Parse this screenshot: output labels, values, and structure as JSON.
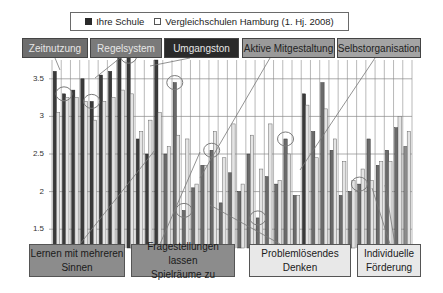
{
  "legend": {
    "series_a": "Ihre Schule",
    "series_b": "Vergleichschulen Hamburg (1. Hj. 2008)"
  },
  "top_labels": [
    {
      "text": "Zeitnutzung",
      "x": 22,
      "w": 66,
      "bg": "#6e6e6e",
      "fg": "#e6e6e6"
    },
    {
      "text": "Regelsystem",
      "x": 90,
      "w": 72,
      "bg": "#7a7a7a",
      "fg": "#e6e6e6"
    },
    {
      "text": "Umgangston",
      "x": 164,
      "w": 75,
      "bg": "#2a2a2a",
      "fg": "#e6e6e6"
    },
    {
      "text": "Aktive Mitgestaltung",
      "x": 242,
      "w": 93,
      "bg": "#9a9a9a",
      "fg": "#222222"
    },
    {
      "text": "Selbstorganisation",
      "x": 337,
      "w": 84,
      "bg": "#a4a4a4",
      "fg": "#222222"
    }
  ],
  "bottom_labels": [
    {
      "line1": "Lernen mit mehreren",
      "line2": "Sinnen",
      "x": 29,
      "w": 96,
      "bg": "#8c8c8c"
    },
    {
      "line1": "Fragestellungen lassen",
      "line2": "Spielräume zu",
      "x": 131,
      "w": 104,
      "bg": "#8c8c8c"
    },
    {
      "line1": "Problemlösendes",
      "line2": "Denken",
      "x": 249,
      "w": 102,
      "bg": "#e8e8e8"
    },
    {
      "line1": "Individuelle",
      "line2": "Förderung",
      "x": 357,
      "w": 64,
      "bg": "#e8e8e8"
    }
  ],
  "colors": {
    "ihre_schule_dark": "#3a3a3a",
    "ihre_schule_mid": "#6a6a6a",
    "ihre_schule_light": "#8c8c8c",
    "vergleich": "#e4e4e4",
    "grid": "#8a8a8a",
    "circle": "#7a7a7a"
  },
  "chart_data": {
    "type": "bar",
    "title": "",
    "xlabel": "",
    "ylabel": "",
    "ylim": [
      1.25,
      3.75
    ],
    "yticks": [
      1.5,
      2,
      2.5,
      3,
      3.5
    ],
    "grid": true,
    "legend_position": "top",
    "categories": [
      "1",
      "2",
      "3",
      "4",
      "5",
      "6",
      "7",
      "8",
      "9",
      "10",
      "11",
      "12",
      "13",
      "14",
      "15",
      "16",
      "17",
      "18",
      "19",
      "20",
      "21",
      "22",
      "23",
      "24",
      "25",
      "26",
      "27",
      "28",
      "29",
      "30",
      "31",
      "32",
      "33",
      "34",
      "35",
      "36",
      "37",
      "38",
      "39"
    ],
    "series": [
      {
        "name": "Ihre Schule",
        "values": [
          3.6,
          3.3,
          3.35,
          3.5,
          3.2,
          3.55,
          3.6,
          3.85,
          3.8,
          2.7,
          2.5,
          3.75,
          2.5,
          3.45,
          1.75,
          2.05,
          2.35,
          2.55,
          1.85,
          2.25,
          2.0,
          2.5,
          1.65,
          2.2,
          2.1,
          2.7,
          1.95,
          3.3,
          2.8,
          3.45,
          2.55,
          1.95,
          2.0,
          2.1,
          2.7,
          2.35,
          2.55,
          2.85,
          2.6
        ],
        "group_shade": [
          "dark",
          "dark",
          "dark",
          "dark",
          "dark",
          "dark",
          "dark",
          "dark",
          "dark",
          "dark",
          "dark",
          "dark",
          "mid",
          "mid",
          "mid",
          "mid",
          "mid",
          "mid",
          "mid",
          "mid",
          "mid",
          "mid",
          "mid",
          "mid",
          "mid",
          "mid",
          "mid",
          "dark",
          "mid",
          "mid",
          "mid",
          "mid",
          "mid",
          "mid",
          "mid",
          "mid",
          "mid",
          "mid",
          "light"
        ]
      },
      {
        "name": "Vergleichschulen Hamburg (1. Hj. 2008)",
        "values": [
          3.05,
          3.25,
          3.25,
          3.2,
          2.95,
          3.2,
          3.25,
          3.35,
          3.3,
          2.8,
          2.95,
          3.05,
          2.6,
          2.75,
          2.7,
          2.1,
          2.35,
          2.8,
          2.45,
          2.9,
          2.1,
          2.75,
          2.3,
          2.9,
          2.15,
          2.5,
          1.95,
          3.15,
          2.45,
          3.1,
          2.7,
          2.4,
          2.15,
          2.3,
          2.15,
          2.4,
          2.4,
          3.0,
          2.8
        ]
      }
    ],
    "highlight_circles": [
      {
        "label": "Zeitnutzung",
        "bar_index": 1
      },
      {
        "label": "Regelsystem",
        "bar_index": 4
      },
      {
        "label": "Umgangston",
        "bar_index": 8
      },
      {
        "label": "Lernen mit mehreren Sinnen",
        "bar_index": 14
      },
      {
        "label": "Fragestellungen lassen Spielräume zu",
        "bar_index": 13
      },
      {
        "label": "Aktive Mitgestaltung",
        "bar_index": 17
      },
      {
        "label": "Selbstorganisation",
        "bar_index": 22
      },
      {
        "label": "Problemlösendes Denken",
        "bar_index": 25
      },
      {
        "label": "Individuelle Förderung",
        "bar_index": 33
      }
    ]
  }
}
